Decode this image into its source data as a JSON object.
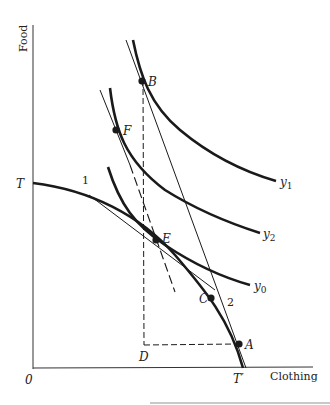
{
  "diagram": {
    "y_axis_label": "Food",
    "x_axis_label": "Clothing",
    "origin_label": "0",
    "points": {
      "T": "T",
      "T_prime": "T′",
      "A": "A",
      "B": "B",
      "C": "C",
      "D": "D",
      "E": "E",
      "F": "F"
    },
    "line_labels": {
      "line1": "1",
      "line2": "2"
    },
    "curve_labels": {
      "y0": "y",
      "y0_sub": "0",
      "y1": "y",
      "y1_sub": "1",
      "y2": "y",
      "y2_sub": "2"
    },
    "colors": {
      "ink": "#1a1a1a",
      "rule": "#c8c8c8"
    }
  }
}
